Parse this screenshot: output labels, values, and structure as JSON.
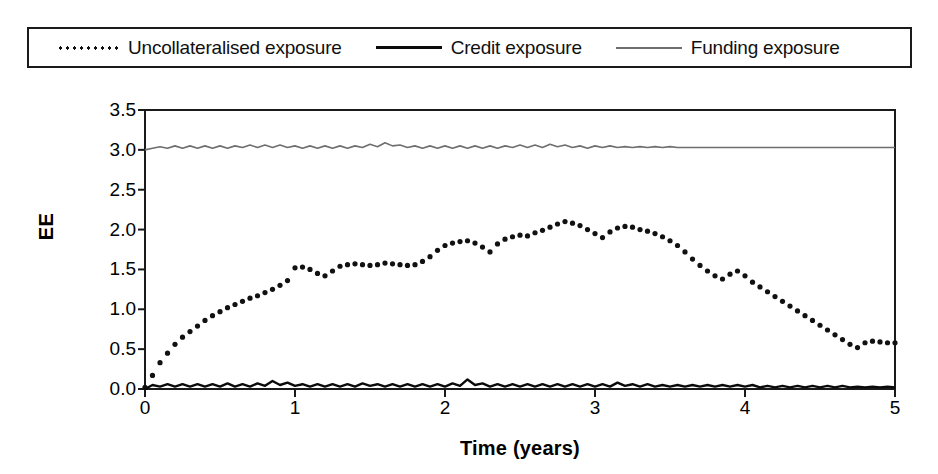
{
  "legend": {
    "entries": [
      {
        "label": "Uncollateralised exposure",
        "style": "dotted",
        "color": "#111111"
      },
      {
        "label": "Credit exposure",
        "style": "solid-thick",
        "color": "#0a0a0a"
      },
      {
        "label": "Funding exposure",
        "style": "solid-thin",
        "color": "#6e6e6e"
      }
    ]
  },
  "chart_data": {
    "type": "line",
    "title": "",
    "xlabel": "Time (years)",
    "ylabel": "EE",
    "xlim": [
      0,
      5
    ],
    "ylim": [
      0.0,
      3.5
    ],
    "xticks": [
      "0",
      "1",
      "2",
      "3",
      "4",
      "5"
    ],
    "yticks": [
      "0.0",
      "0.5",
      "1.0",
      "1.5",
      "2.0",
      "2.5",
      "3.0",
      "3.5"
    ],
    "grid": false,
    "legend_position": "top",
    "series": [
      {
        "name": "Uncollateralised exposure",
        "style": "dotted",
        "color": "#111111",
        "x": [
          0.0,
          0.05,
          0.1,
          0.15,
          0.2,
          0.25,
          0.3,
          0.35,
          0.4,
          0.45,
          0.5,
          0.55,
          0.6,
          0.65,
          0.7,
          0.75,
          0.8,
          0.85,
          0.9,
          0.95,
          1.0,
          1.05,
          1.1,
          1.15,
          1.2,
          1.25,
          1.3,
          1.35,
          1.4,
          1.45,
          1.5,
          1.55,
          1.6,
          1.65,
          1.7,
          1.75,
          1.8,
          1.85,
          1.9,
          1.95,
          2.0,
          2.05,
          2.1,
          2.15,
          2.2,
          2.25,
          2.3,
          2.35,
          2.4,
          2.45,
          2.5,
          2.55,
          2.6,
          2.65,
          2.7,
          2.75,
          2.8,
          2.85,
          2.9,
          2.95,
          3.0,
          3.05,
          3.1,
          3.15,
          3.2,
          3.25,
          3.3,
          3.35,
          3.4,
          3.45,
          3.5,
          3.55,
          3.6,
          3.65,
          3.7,
          3.75,
          3.8,
          3.85,
          3.9,
          3.95,
          4.0,
          4.05,
          4.1,
          4.15,
          4.2,
          4.25,
          4.3,
          4.35,
          4.4,
          4.45,
          4.5,
          4.55,
          4.6,
          4.65,
          4.7,
          4.75,
          4.8,
          4.85,
          4.9,
          4.95,
          5.0
        ],
        "y": [
          0.02,
          0.17,
          0.33,
          0.45,
          0.56,
          0.65,
          0.72,
          0.79,
          0.86,
          0.92,
          0.97,
          1.02,
          1.06,
          1.1,
          1.14,
          1.17,
          1.21,
          1.25,
          1.3,
          1.36,
          1.52,
          1.53,
          1.5,
          1.45,
          1.42,
          1.48,
          1.54,
          1.56,
          1.57,
          1.56,
          1.55,
          1.56,
          1.58,
          1.57,
          1.56,
          1.55,
          1.56,
          1.6,
          1.66,
          1.74,
          1.8,
          1.83,
          1.85,
          1.86,
          1.83,
          1.78,
          1.72,
          1.82,
          1.88,
          1.91,
          1.93,
          1.92,
          1.96,
          1.99,
          2.03,
          2.07,
          2.1,
          2.08,
          2.05,
          2.0,
          1.95,
          1.9,
          1.97,
          2.02,
          2.04,
          2.03,
          2.0,
          1.98,
          1.95,
          1.91,
          1.86,
          1.8,
          1.72,
          1.63,
          1.55,
          1.48,
          1.42,
          1.38,
          1.44,
          1.48,
          1.42,
          1.34,
          1.28,
          1.22,
          1.16,
          1.1,
          1.04,
          0.98,
          0.92,
          0.86,
          0.8,
          0.74,
          0.68,
          0.62,
          0.56,
          0.52,
          0.58,
          0.6,
          0.59,
          0.58,
          0.58
        ]
      },
      {
        "name": "Credit exposure",
        "style": "solid-thick",
        "color": "#0a0a0a",
        "x": [
          0.0,
          0.05,
          0.1,
          0.15,
          0.2,
          0.25,
          0.3,
          0.35,
          0.4,
          0.45,
          0.5,
          0.55,
          0.6,
          0.65,
          0.7,
          0.75,
          0.8,
          0.85,
          0.9,
          0.95,
          1.0,
          1.05,
          1.1,
          1.15,
          1.2,
          1.25,
          1.3,
          1.35,
          1.4,
          1.45,
          1.5,
          1.55,
          1.6,
          1.65,
          1.7,
          1.75,
          1.8,
          1.85,
          1.9,
          1.95,
          2.0,
          2.05,
          2.1,
          2.15,
          2.2,
          2.25,
          2.3,
          2.35,
          2.4,
          2.45,
          2.5,
          2.55,
          2.6,
          2.65,
          2.7,
          2.75,
          2.8,
          2.85,
          2.9,
          2.95,
          3.0,
          3.05,
          3.1,
          3.15,
          3.2,
          3.25,
          3.3,
          3.35,
          3.4,
          3.45,
          3.5,
          3.55,
          3.6,
          3.65,
          3.7,
          3.75,
          3.8,
          3.85,
          3.9,
          3.95,
          4.0,
          4.05,
          4.1,
          4.15,
          4.2,
          4.25,
          4.3,
          4.35,
          4.4,
          4.45,
          4.5,
          4.55,
          4.6,
          4.65,
          4.7,
          4.75,
          4.8,
          4.85,
          4.9,
          4.95,
          5.0
        ],
        "y": [
          0.0,
          0.05,
          0.03,
          0.06,
          0.03,
          0.06,
          0.03,
          0.06,
          0.03,
          0.06,
          0.03,
          0.07,
          0.03,
          0.06,
          0.03,
          0.07,
          0.04,
          0.1,
          0.05,
          0.08,
          0.04,
          0.06,
          0.03,
          0.06,
          0.03,
          0.06,
          0.03,
          0.06,
          0.03,
          0.07,
          0.04,
          0.06,
          0.03,
          0.06,
          0.03,
          0.06,
          0.03,
          0.06,
          0.03,
          0.06,
          0.03,
          0.07,
          0.04,
          0.12,
          0.05,
          0.07,
          0.03,
          0.06,
          0.03,
          0.06,
          0.03,
          0.06,
          0.03,
          0.06,
          0.03,
          0.06,
          0.03,
          0.06,
          0.03,
          0.06,
          0.03,
          0.06,
          0.03,
          0.08,
          0.04,
          0.06,
          0.03,
          0.06,
          0.03,
          0.05,
          0.03,
          0.05,
          0.03,
          0.05,
          0.03,
          0.05,
          0.03,
          0.05,
          0.03,
          0.05,
          0.03,
          0.05,
          0.02,
          0.04,
          0.02,
          0.04,
          0.02,
          0.04,
          0.02,
          0.04,
          0.02,
          0.04,
          0.02,
          0.04,
          0.02,
          0.03,
          0.02,
          0.03,
          0.02,
          0.03,
          0.02
        ]
      },
      {
        "name": "Funding exposure",
        "style": "solid-thin",
        "color": "#6e6e6e",
        "x": [
          0.0,
          0.05,
          0.1,
          0.15,
          0.2,
          0.25,
          0.3,
          0.35,
          0.4,
          0.45,
          0.5,
          0.55,
          0.6,
          0.65,
          0.7,
          0.75,
          0.8,
          0.85,
          0.9,
          0.95,
          1.0,
          1.05,
          1.1,
          1.15,
          1.2,
          1.25,
          1.3,
          1.35,
          1.4,
          1.45,
          1.5,
          1.55,
          1.6,
          1.65,
          1.7,
          1.75,
          1.8,
          1.85,
          1.9,
          1.95,
          2.0,
          2.05,
          2.1,
          2.15,
          2.2,
          2.25,
          2.3,
          2.35,
          2.4,
          2.45,
          2.5,
          2.55,
          2.6,
          2.65,
          2.7,
          2.75,
          2.8,
          2.85,
          2.9,
          2.95,
          3.0,
          3.05,
          3.1,
          3.15,
          3.2,
          3.25,
          3.3,
          3.35,
          3.4,
          3.45,
          3.5,
          3.55,
          3.6,
          3.65,
          3.7,
          3.75,
          3.8,
          3.85,
          3.9,
          3.95,
          4.0,
          4.05,
          4.1,
          4.15,
          4.2,
          4.25,
          4.3,
          4.35,
          4.4,
          4.45,
          4.5,
          4.55,
          4.6,
          4.65,
          4.7,
          4.75,
          4.8,
          4.85,
          4.9,
          4.95,
          5.0
        ],
        "y": [
          3.0,
          3.02,
          3.04,
          3.02,
          3.05,
          3.02,
          3.05,
          3.02,
          3.05,
          3.02,
          3.05,
          3.02,
          3.05,
          3.03,
          3.06,
          3.03,
          3.06,
          3.03,
          3.06,
          3.03,
          3.05,
          3.02,
          3.05,
          3.02,
          3.05,
          3.02,
          3.05,
          3.02,
          3.05,
          3.03,
          3.07,
          3.04,
          3.09,
          3.05,
          3.06,
          3.03,
          3.05,
          3.02,
          3.05,
          3.02,
          3.05,
          3.02,
          3.05,
          3.02,
          3.05,
          3.02,
          3.05,
          3.02,
          3.05,
          3.03,
          3.06,
          3.03,
          3.06,
          3.03,
          3.07,
          3.04,
          3.06,
          3.03,
          3.05,
          3.02,
          3.05,
          3.03,
          3.05,
          3.03,
          3.04,
          3.03,
          3.04,
          3.03,
          3.04,
          3.03,
          3.04,
          3.03,
          3.03,
          3.03,
          3.03,
          3.03,
          3.03,
          3.03,
          3.03,
          3.03,
          3.03,
          3.03,
          3.03,
          3.03,
          3.03,
          3.03,
          3.03,
          3.03,
          3.03,
          3.03,
          3.03,
          3.03,
          3.03,
          3.03,
          3.03,
          3.03,
          3.03,
          3.03,
          3.03,
          3.03,
          3.03
        ]
      }
    ]
  }
}
